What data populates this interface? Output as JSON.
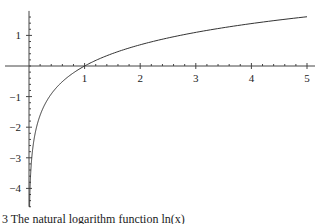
{
  "chart_data": {
    "type": "line",
    "title": "",
    "xlabel": "",
    "ylabel": "",
    "xlim": [
      0,
      5
    ],
    "ylim": [
      -4.6,
      1.8
    ],
    "x_ticks": [
      1,
      2,
      3,
      4,
      5
    ],
    "x_tick_labels": [
      "1",
      "2",
      "3",
      "4",
      "5"
    ],
    "y_ticks": [
      1,
      -1,
      -2,
      -3,
      -4
    ],
    "y_tick_labels": [
      "1",
      "−1",
      "−2",
      "−3",
      "−4"
    ],
    "grid": false,
    "legend": null,
    "series": [
      {
        "name": "ln(x)",
        "x": [
          0.01,
          0.05,
          0.1,
          0.2,
          0.3,
          0.5,
          0.75,
          1,
          1.5,
          2,
          2.5,
          3,
          3.5,
          4,
          4.5,
          5
        ],
        "y": [
          -4.61,
          -3.0,
          -2.3,
          -1.61,
          -1.2,
          -0.69,
          -0.29,
          0,
          0.41,
          0.69,
          0.92,
          1.1,
          1.25,
          1.39,
          1.5,
          1.61
        ]
      }
    ]
  },
  "caption": "3 The natural logarithm function ln(x)"
}
